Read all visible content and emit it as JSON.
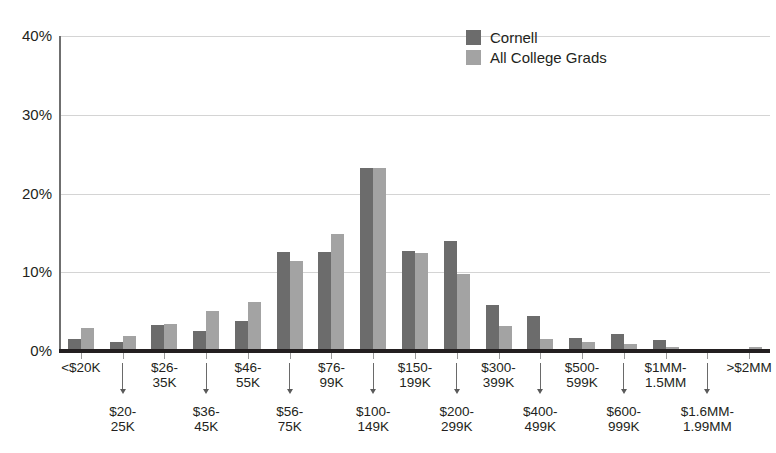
{
  "chart_data": {
    "type": "bar",
    "title": "",
    "subtitle": "",
    "xlabel": "",
    "ylabel": "",
    "ylim": [
      0,
      40
    ],
    "ytick_labels": [
      "0%",
      "10%",
      "20%",
      "30%",
      "40%"
    ],
    "ytick_values": [
      0,
      10,
      20,
      30,
      40
    ],
    "grid": true,
    "legend_position": "top-right",
    "categories": [
      "<$20K",
      "$20-\n25K",
      "$26-\n35K",
      "$36-\n45K",
      "$46-\n55K",
      "$56-\n75K",
      "$76-\n99K",
      "$100-\n149K",
      "$150-\n199K",
      "$200-\n299K",
      "$300-\n399K",
      "$400-\n499K",
      "$500-\n599K",
      "$600-\n999K",
      "$1MM-\n1.5MM",
      "$1.6MM-\n1.99MM",
      ">$2MM"
    ],
    "series": [
      {
        "name": "Cornell",
        "color": "#6c6c6c",
        "values": [
          1.5,
          1.2,
          3.3,
          2.5,
          3.8,
          12.6,
          12.6,
          23.3,
          12.7,
          14.0,
          5.9,
          4.4,
          1.7,
          2.1,
          1.4,
          0.3,
          0.2
        ]
      },
      {
        "name": "All College Grads",
        "color": "#a3a3a3",
        "values": [
          2.9,
          1.9,
          3.4,
          5.1,
          6.2,
          11.4,
          14.9,
          23.2,
          12.4,
          9.8,
          3.2,
          1.5,
          1.1,
          0.9,
          0.5,
          0.2,
          0.5
        ]
      }
    ]
  },
  "legend": {
    "items": [
      {
        "label": "Cornell",
        "color": "#6c6c6c"
      },
      {
        "label": "All College Grads",
        "color": "#a3a3a3"
      }
    ]
  }
}
